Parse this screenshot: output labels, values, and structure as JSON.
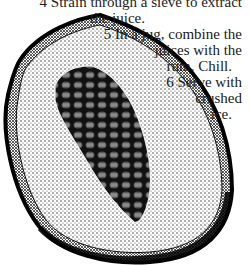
{
  "page": {
    "type": "recipe-fragment",
    "illustration": {
      "subject": "halved papaya with seeds",
      "style": "black-and-white stippled engraving"
    },
    "steps": [
      {
        "number": "4",
        "text_lines": [
          "4 Strain through a sieve to extract",
          "the juice."
        ],
        "partial": true
      },
      {
        "number": "5",
        "text_lines": [
          "5 In a jug, combine the",
          "juices with the",
          "rum. Chill."
        ]
      },
      {
        "number": "6",
        "text_lines": [
          "6 Serve with",
          "crushed",
          "ice."
        ]
      }
    ]
  },
  "colors": {
    "ink": "#1a1a1a",
    "paper": "#ffffff"
  }
}
